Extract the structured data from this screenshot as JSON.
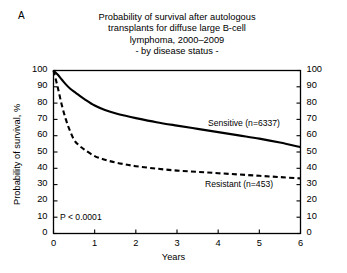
{
  "panel": {
    "label": "A"
  },
  "title": {
    "lines": [
      "Probability of survival after autologous",
      "transplants for diffuse large B-cell",
      "lymphoma, 2000–2009",
      "- by disease status -"
    ]
  },
  "annotations": {
    "pvalue": "P < 0.0001"
  },
  "chart_data": {
    "type": "line",
    "title": "Probability of survival after autologous transplants for diffuse large B-cell lymphoma, 2000–2009 - by disease status -",
    "subtitle": "- by disease status -",
    "xlabel": "Years",
    "ylabel": "Probability of survival, %",
    "xlim": [
      0,
      6
    ],
    "ylim": [
      0,
      100
    ],
    "xticks": [
      0,
      1,
      2,
      3,
      4,
      5,
      6
    ],
    "xtick_labels": [
      "0",
      "1",
      "2",
      "3",
      "4",
      "5",
      "6"
    ],
    "yticks": [
      0,
      10,
      20,
      30,
      40,
      50,
      60,
      70,
      80,
      90,
      100
    ],
    "ytick_labels": [
      "0",
      "10",
      "20",
      "30",
      "40",
      "50",
      "60",
      "70",
      "80",
      "90",
      "100"
    ],
    "y_axis_right": true,
    "y_axis_right_ticks": [
      0,
      10,
      20,
      30,
      40,
      50,
      60,
      70,
      80,
      90,
      100
    ],
    "y_axis_right_labels": [
      "0",
      "10",
      "20",
      "30",
      "40",
      "50",
      "60",
      "70",
      "80",
      "90",
      "100"
    ],
    "grid": false,
    "legend_position": "inline-right",
    "annotation_pvalue": "P < 0.0001",
    "series": [
      {
        "name": "Sensitive (n=6337)",
        "label": "Sensitive (n=6337)",
        "n": 6337,
        "style": "solid",
        "color": "#000000",
        "x": [
          0,
          0.1,
          0.2,
          0.3,
          0.4,
          0.5,
          0.6,
          0.75,
          1.0,
          1.25,
          1.5,
          1.75,
          2.0,
          2.5,
          3.0,
          3.5,
          4.0,
          4.5,
          5.0,
          5.5,
          6.0
        ],
        "values": [
          100,
          97.5,
          94.5,
          91.5,
          89,
          87,
          85.2,
          82.5,
          78.5,
          75.8,
          73.8,
          72.2,
          70.8,
          68.3,
          66.2,
          64.2,
          62.2,
          60.2,
          58.2,
          55.8,
          53.0
        ]
      },
      {
        "name": "Resistant (n=453)",
        "label": "Resistant (n=453)",
        "n": 453,
        "style": "dashed",
        "color": "#000000",
        "x": [
          0,
          0.1,
          0.2,
          0.3,
          0.4,
          0.5,
          0.6,
          0.75,
          1.0,
          1.25,
          1.5,
          1.75,
          2.0,
          2.5,
          3.0,
          3.5,
          4.0,
          4.5,
          5.0,
          5.5,
          6.0
        ],
        "values": [
          100,
          90,
          79,
          70,
          63,
          57.5,
          54.5,
          51.5,
          47.5,
          45.2,
          43.6,
          42.4,
          41.3,
          39.8,
          38.6,
          37.8,
          37.0,
          36.2,
          35.4,
          34.6,
          33.8
        ]
      }
    ]
  }
}
